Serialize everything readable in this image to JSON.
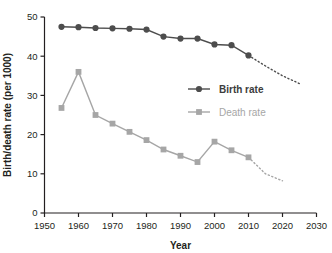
{
  "chart_data": {
    "type": "line",
    "title": "",
    "xlabel": "Year",
    "ylabel": "Birth/death rate (per 1000)",
    "xlim": [
      1950,
      2030
    ],
    "ylim": [
      0,
      50
    ],
    "xticks": [
      1950,
      1960,
      1970,
      1980,
      1990,
      2000,
      2010,
      2020,
      2030
    ],
    "yticks": [
      0,
      10,
      20,
      30,
      40,
      50
    ],
    "grid": false,
    "legend_position": "center-right",
    "series": [
      {
        "name": "Birth rate",
        "color": "#4d4d4d",
        "marker": "circle",
        "x": [
          1955,
          1960,
          1965,
          1970,
          1975,
          1980,
          1985,
          1990,
          1995,
          2000,
          2005,
          2010
        ],
        "values": [
          47.5,
          47.4,
          47.2,
          47.1,
          47.0,
          46.8,
          45.0,
          44.5,
          44.5,
          43.0,
          42.8,
          40.2
        ],
        "projection": {
          "dashed": true,
          "x": [
            2010,
            2015,
            2020,
            2025
          ],
          "values": [
            40.2,
            37.5,
            35.0,
            33.0
          ]
        }
      },
      {
        "name": "Death rate",
        "color": "#a6a6a6",
        "marker": "square",
        "x": [
          1955,
          1960,
          1965,
          1970,
          1975,
          1980,
          1985,
          1990,
          1995,
          2000,
          2005,
          2010
        ],
        "values": [
          26.8,
          36.0,
          25.0,
          22.8,
          20.7,
          18.6,
          16.2,
          14.6,
          13.0,
          18.2,
          16.0,
          14.2
        ],
        "projection": {
          "dashed": true,
          "x": [
            2010,
            2015,
            2020
          ],
          "values": [
            14.2,
            10.0,
            8.2
          ]
        }
      }
    ]
  },
  "legend": {
    "items": [
      {
        "label": "Birth rate"
      },
      {
        "label": "Death rate"
      }
    ]
  },
  "axis": {
    "x_title": "Year",
    "y_title": "Birth/death rate (per 1000)",
    "x_tick_labels": [
      "1950",
      "1960",
      "1970",
      "1980",
      "1990",
      "2000",
      "2010",
      "2020",
      "2030"
    ],
    "y_tick_labels": [
      "0",
      "10",
      "20",
      "30",
      "40",
      "50"
    ]
  }
}
